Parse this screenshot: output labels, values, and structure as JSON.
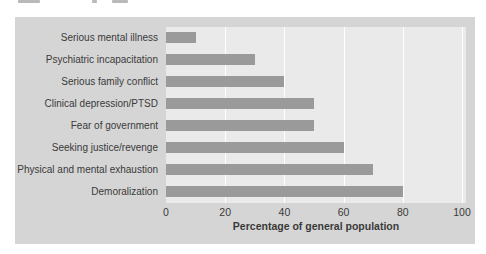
{
  "chart_data": {
    "type": "bar",
    "orientation": "horizontal",
    "title": "",
    "categories": [
      "Serious mental illness",
      "Psychiatric incapacitation",
      "Serious family conflict",
      "Clinical depression/PTSD",
      "Fear of government",
      "Seeking justice/revenge",
      "Physical and mental exhaustion",
      "Demoralization"
    ],
    "values": [
      10,
      30,
      40,
      50,
      50,
      60,
      70,
      80
    ],
    "xlabel": "Percentage of general population",
    "ylabel": "",
    "xlim": [
      0,
      100
    ],
    "xticks": [
      0,
      20,
      40,
      60,
      80,
      100
    ],
    "grid": "vertical white gridlines at each x tick, plot background shaded",
    "legend": "none",
    "colors": {
      "bar": "#9a9a9a",
      "plot_bg": "#eaeaea",
      "panel_bg": "#d5d5d5",
      "gridline": "#ffffff",
      "text": "#3a3a3a",
      "page_bg": "#ffffff"
    }
  }
}
